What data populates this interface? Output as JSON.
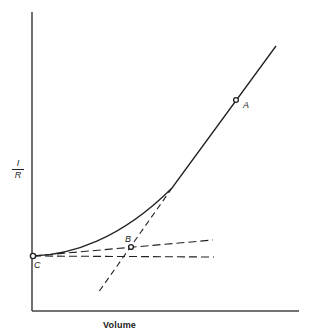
{
  "diagram": {
    "x_axis_label": "Volume",
    "y_axis_label": {
      "numerator": "I",
      "denominator": "R"
    },
    "points": {
      "A": {
        "label": "A"
      },
      "B": {
        "label": "B"
      },
      "C": {
        "label": "C"
      }
    },
    "colors": {
      "line": "#222222",
      "background": "#ffffff"
    }
  }
}
